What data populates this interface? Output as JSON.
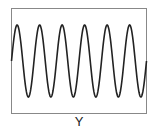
{
  "figure": {
    "label": "Y",
    "frame_color": "#888888",
    "wave_color": "#222222"
  },
  "chart_data": {
    "type": "line",
    "title": "",
    "xlabel": "Y",
    "ylabel": "",
    "periods": 6,
    "amplitude": 1,
    "phase": "sine (starts at zero, rising)",
    "grid": false,
    "axes_ticks": false
  }
}
